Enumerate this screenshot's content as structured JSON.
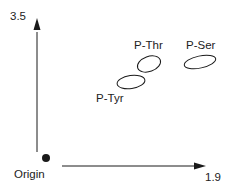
{
  "diagram": {
    "axes": {
      "y_max_label": "3.5",
      "x_max_label": "1.9",
      "origin_label": "Origin"
    },
    "regions": [
      {
        "label": "P-Tyr"
      },
      {
        "label": "P-Thr"
      },
      {
        "label": "P-Ser"
      }
    ],
    "colors": {
      "stroke": "#1a1a1a",
      "background": "#ffffff"
    }
  }
}
